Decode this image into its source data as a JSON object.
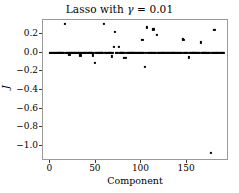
{
  "chart_data": {
    "type": "scatter",
    "title": "Lasso with γ = 0.01",
    "title_prefix": "Lasso with ",
    "title_symbol": "γ",
    "title_suffix": " = 0.01",
    "xlabel": "Component",
    "ylabel": "J",
    "xlim": [
      -8,
      196
    ],
    "ylim": [
      -1.16,
      0.35
    ],
    "xticks": [
      0,
      50,
      100,
      150
    ],
    "xtick_labels": [
      "0",
      "50",
      "100",
      "150"
    ],
    "yticks": [
      0.2,
      0.0,
      -0.2,
      -0.4,
      -0.6,
      -0.8,
      -1.0
    ],
    "ytick_labels": [
      "0.2",
      "0.0",
      "−0.2",
      "−0.4",
      "−0.6",
      "−0.8",
      "−1.0"
    ],
    "grid": false,
    "legend": null,
    "marker": "square",
    "marker_color": "#000000",
    "marker_size": 2.2,
    "axes_facecolor": "#ffffff",
    "figure_facecolor": "#ffffff",
    "spine_color": "#9a9a9a",
    "points": [
      [
        0,
        0.0
      ],
      [
        1,
        0.0
      ],
      [
        2,
        0.0
      ],
      [
        3,
        0.0
      ],
      [
        4,
        0.0
      ],
      [
        5,
        0.0
      ],
      [
        6,
        0.0
      ],
      [
        7,
        0.0
      ],
      [
        8,
        0.0
      ],
      [
        9,
        0.0
      ],
      [
        10,
        0.0
      ],
      [
        11,
        0.0
      ],
      [
        12,
        0.0
      ],
      [
        13,
        0.0
      ],
      [
        14,
        0.0
      ],
      [
        15,
        0.0
      ],
      [
        16,
        0.31
      ],
      [
        17,
        0.0
      ],
      [
        18,
        0.0
      ],
      [
        19,
        0.0
      ],
      [
        20,
        0.0
      ],
      [
        21,
        -0.02
      ],
      [
        22,
        0.0
      ],
      [
        23,
        0.0
      ],
      [
        24,
        0.0
      ],
      [
        25,
        0.0
      ],
      [
        26,
        0.0
      ],
      [
        27,
        0.0
      ],
      [
        28,
        0.0
      ],
      [
        29,
        0.0
      ],
      [
        30,
        0.0
      ],
      [
        31,
        0.0
      ],
      [
        32,
        0.0
      ],
      [
        33,
        -0.03
      ],
      [
        34,
        0.0
      ],
      [
        35,
        0.0
      ],
      [
        36,
        0.0
      ],
      [
        37,
        0.0
      ],
      [
        38,
        0.0
      ],
      [
        39,
        0.0
      ],
      [
        40,
        0.0
      ],
      [
        41,
        0.0
      ],
      [
        42,
        0.0
      ],
      [
        43,
        0.0
      ],
      [
        44,
        0.0
      ],
      [
        45,
        0.0
      ],
      [
        46,
        0.0
      ],
      [
        47,
        -0.03
      ],
      [
        48,
        0.0
      ],
      [
        49,
        -0.11
      ],
      [
        50,
        0.0
      ],
      [
        51,
        0.0
      ],
      [
        52,
        0.0
      ],
      [
        53,
        0.0
      ],
      [
        54,
        0.0
      ],
      [
        55,
        0.0
      ],
      [
        56,
        0.0
      ],
      [
        57,
        0.0
      ],
      [
        58,
        0.0
      ],
      [
        59,
        0.31
      ],
      [
        60,
        0.0
      ],
      [
        61,
        0.0
      ],
      [
        62,
        0.0
      ],
      [
        63,
        0.0
      ],
      [
        64,
        0.0
      ],
      [
        65,
        0.0
      ],
      [
        66,
        0.0
      ],
      [
        67,
        0.0
      ],
      [
        68,
        -0.04
      ],
      [
        69,
        0.0
      ],
      [
        70,
        0.06
      ],
      [
        71,
        0.22
      ],
      [
        72,
        0.0
      ],
      [
        73,
        0.0
      ],
      [
        74,
        0.0
      ],
      [
        75,
        0.06
      ],
      [
        76,
        0.0
      ],
      [
        77,
        0.0
      ],
      [
        78,
        0.0
      ],
      [
        79,
        0.0
      ],
      [
        80,
        0.0
      ],
      [
        81,
        -0.06
      ],
      [
        82,
        0.0
      ],
      [
        83,
        -0.06
      ],
      [
        84,
        0.0
      ],
      [
        85,
        0.0
      ],
      [
        86,
        0.0
      ],
      [
        87,
        0.0
      ],
      [
        88,
        0.0
      ],
      [
        89,
        0.0
      ],
      [
        90,
        0.0
      ],
      [
        91,
        0.0
      ],
      [
        92,
        0.0
      ],
      [
        93,
        0.0
      ],
      [
        94,
        0.0
      ],
      [
        95,
        0.0
      ],
      [
        96,
        0.0
      ],
      [
        97,
        0.0
      ],
      [
        98,
        0.0
      ],
      [
        99,
        0.0
      ],
      [
        100,
        0.0
      ],
      [
        101,
        0.14
      ],
      [
        102,
        0.0
      ],
      [
        103,
        0.0
      ],
      [
        104,
        -0.15
      ],
      [
        105,
        0.0
      ],
      [
        106,
        0.27
      ],
      [
        107,
        0.0
      ],
      [
        108,
        0.0
      ],
      [
        109,
        0.0
      ],
      [
        110,
        0.0
      ],
      [
        111,
        0.0
      ],
      [
        112,
        0.0
      ],
      [
        113,
        0.25
      ],
      [
        114,
        0.0
      ],
      [
        115,
        0.0
      ],
      [
        116,
        0.0
      ],
      [
        117,
        0.19
      ],
      [
        118,
        0.0
      ],
      [
        119,
        0.0
      ],
      [
        120,
        0.0
      ],
      [
        121,
        0.0
      ],
      [
        122,
        0.0
      ],
      [
        123,
        0.0
      ],
      [
        124,
        0.0
      ],
      [
        125,
        0.0
      ],
      [
        126,
        0.0
      ],
      [
        127,
        0.0
      ],
      [
        128,
        0.0
      ],
      [
        129,
        0.0
      ],
      [
        130,
        0.0
      ],
      [
        131,
        0.0
      ],
      [
        132,
        0.0
      ],
      [
        133,
        0.0
      ],
      [
        134,
        0.0
      ],
      [
        135,
        0.0
      ],
      [
        136,
        0.0
      ],
      [
        137,
        0.0
      ],
      [
        138,
        0.0
      ],
      [
        139,
        0.0
      ],
      [
        140,
        0.0
      ],
      [
        141,
        0.0
      ],
      [
        142,
        0.0
      ],
      [
        143,
        0.0
      ],
      [
        144,
        0.0
      ],
      [
        145,
        0.15
      ],
      [
        146,
        0.14
      ],
      [
        147,
        0.0
      ],
      [
        148,
        0.0
      ],
      [
        149,
        0.0
      ],
      [
        150,
        0.0
      ],
      [
        151,
        0.0
      ],
      [
        152,
        -0.05
      ],
      [
        153,
        0.0
      ],
      [
        154,
        0.0
      ],
      [
        155,
        0.0
      ],
      [
        156,
        0.0
      ],
      [
        157,
        0.0
      ],
      [
        158,
        0.0
      ],
      [
        159,
        0.0
      ],
      [
        160,
        0.0
      ],
      [
        161,
        0.0
      ],
      [
        162,
        0.0
      ],
      [
        163,
        0.0
      ],
      [
        164,
        0.0
      ],
      [
        165,
        0.11
      ],
      [
        166,
        0.0
      ],
      [
        167,
        0.0
      ],
      [
        168,
        0.0
      ],
      [
        169,
        0.0
      ],
      [
        170,
        0.0
      ],
      [
        171,
        0.0
      ],
      [
        172,
        0.0
      ],
      [
        173,
        0.0
      ],
      [
        174,
        0.0
      ],
      [
        175,
        0.0
      ],
      [
        176,
        -1.07
      ],
      [
        177,
        0.0
      ],
      [
        178,
        0.0
      ],
      [
        179,
        0.0
      ],
      [
        180,
        0.24
      ],
      [
        181,
        0.0
      ],
      [
        182,
        0.0
      ],
      [
        183,
        0.0
      ],
      [
        184,
        0.0
      ],
      [
        185,
        0.0
      ],
      [
        186,
        0.0
      ],
      [
        187,
        0.0
      ],
      [
        188,
        0.0
      ],
      [
        189,
        0.0
      ],
      [
        190,
        0.0
      ]
    ]
  }
}
